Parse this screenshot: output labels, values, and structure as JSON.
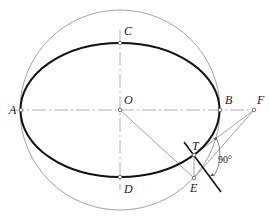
{
  "diagram": {
    "colors": {
      "ellipse": "#111111",
      "circle": "#888888",
      "axis": "#999999",
      "construction": "#888888",
      "tangent": "#111111",
      "point": "#ffffff"
    },
    "labels": {
      "A": "A",
      "B": "B",
      "C": "C",
      "D": "D",
      "O": "O",
      "F": "F",
      "T": "T",
      "E": "E",
      "angle": "90°"
    },
    "elements": [
      {
        "type": "ellipse",
        "name": "main-ellipse",
        "center": "O",
        "major_axis": "AB",
        "minor_axis": "CD"
      },
      {
        "type": "circle",
        "name": "auxiliary-circle",
        "center": "O",
        "diameter": "AB"
      },
      {
        "type": "centerline",
        "name": "major-axis",
        "from": "A",
        "to": "F"
      },
      {
        "type": "centerline",
        "name": "minor-axis",
        "through": [
          "C",
          "O",
          "D"
        ]
      },
      {
        "type": "line",
        "name": "radius-OE",
        "from": "O",
        "to": "E"
      },
      {
        "type": "line",
        "name": "segment-TE",
        "from": "T",
        "to": "E"
      },
      {
        "type": "line",
        "name": "segment-FT",
        "from": "F",
        "to": "T"
      },
      {
        "type": "line",
        "name": "segment-FE",
        "from": "F",
        "to": "E"
      },
      {
        "type": "line",
        "name": "tangent-at-T",
        "through": "T"
      },
      {
        "type": "angle-mark",
        "name": "right-angle",
        "value": "90°"
      }
    ]
  }
}
